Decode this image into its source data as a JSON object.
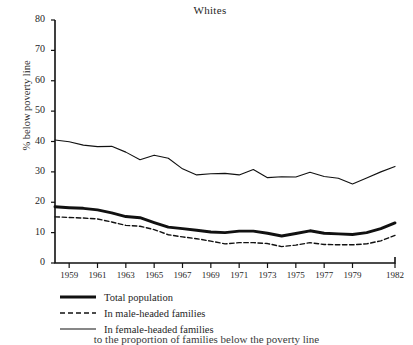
{
  "chart_data": {
    "type": "line",
    "title": "Whites",
    "xlabel": "",
    "ylabel": "% below poverty line",
    "xlim": [
      1958,
      1982
    ],
    "ylim": [
      0,
      80
    ],
    "yticks": [
      0,
      10,
      20,
      30,
      40,
      50,
      60,
      70,
      80
    ],
    "xticks": [
      1959,
      1961,
      1963,
      1965,
      1967,
      1969,
      1971,
      1973,
      1975,
      1977,
      1979,
      1982
    ],
    "grid": false,
    "legend_position": "below-left",
    "x": [
      1958,
      1959,
      1960,
      1961,
      1962,
      1963,
      1964,
      1965,
      1966,
      1967,
      1968,
      1969,
      1970,
      1971,
      1972,
      1973,
      1974,
      1975,
      1976,
      1977,
      1978,
      1979,
      1980,
      1981,
      1982
    ],
    "series": [
      {
        "name": "Total population",
        "style": "thick-solid",
        "color": "#111111",
        "values": [
          18.5,
          18.2,
          18.0,
          17.5,
          16.5,
          15.3,
          14.9,
          13.3,
          11.8,
          11.3,
          10.8,
          10.2,
          10.0,
          10.5,
          10.5,
          9.8,
          8.9,
          9.7,
          10.6,
          9.8,
          9.6,
          9.4,
          10.0,
          11.3,
          13.2
        ]
      },
      {
        "name": "In male-headed families",
        "style": "dashed",
        "color": "#111111",
        "values": [
          15.2,
          15.0,
          14.8,
          14.5,
          13.5,
          12.4,
          12.1,
          11.0,
          9.3,
          8.6,
          8.0,
          7.2,
          6.3,
          6.7,
          6.7,
          6.4,
          5.4,
          5.9,
          6.7,
          6.1,
          6.0,
          6.0,
          6.3,
          7.3,
          9.1
        ]
      },
      {
        "name": "In female-headed families",
        "style": "thin-solid",
        "color": "#111111",
        "values": [
          40.5,
          39.9,
          38.8,
          38.3,
          38.4,
          36.5,
          34.0,
          35.5,
          34.5,
          31.0,
          29.0,
          29.4,
          29.5,
          29.0,
          30.8,
          28.1,
          28.4,
          28.3,
          29.9,
          28.5,
          27.9,
          26.0,
          28.0,
          30.0,
          31.8
        ]
      }
    ]
  },
  "axis": {
    "ytick_labels": [
      "80",
      "70",
      "60",
      "50",
      "40",
      "30",
      "20",
      "10",
      "0"
    ],
    "xtick_labels": [
      "1959",
      "1961",
      "1963",
      "1965",
      "1967",
      "1969",
      "1971",
      "1973",
      "1975",
      "1977",
      "1979",
      "1982"
    ]
  },
  "legend": {
    "items": [
      {
        "label": "Total population",
        "key": "thick-solid-line-key"
      },
      {
        "label": "In male-headed families",
        "key": "dashed-line-key"
      },
      {
        "label": "In female-headed families",
        "key": "thin-solid-line-key"
      }
    ]
  },
  "footer": {
    "text": "to the proportion of families below the poverty line"
  }
}
